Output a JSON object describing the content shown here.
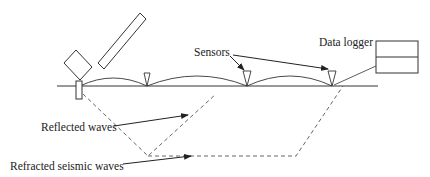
{
  "diagram": {
    "labels": {
      "sensors": "Sensors",
      "data_logger": "Data logger",
      "reflected": "Reflected waves",
      "refracted": "Refracted seismic waves"
    },
    "components": [
      "hammer",
      "strike-plate",
      "ground-surface",
      "sensor-1",
      "sensor-2",
      "sensor-3",
      "data-logger",
      "reflected-wave-path",
      "refracted-wave-path"
    ],
    "colors": {
      "line": "#333333",
      "dashed": "#555555",
      "background": "#ffffff"
    }
  }
}
